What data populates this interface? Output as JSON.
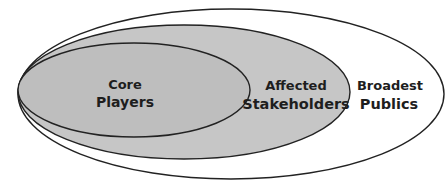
{
  "diagram": {
    "type": "nested-ellipses",
    "layers": [
      {
        "id": "broadest-publics",
        "line1": "Broadest",
        "line2": "Publics",
        "fill": "#ffffff",
        "stroke": "#222222"
      },
      {
        "id": "affected-stakeholders",
        "line1": "Affected",
        "line2": "Stakeholders",
        "fill": "#c4c4c4",
        "stroke": "#222222"
      },
      {
        "id": "core-players",
        "line1": "Core",
        "line2": "Players",
        "fill": "#bdbdbd",
        "stroke": "#222222"
      }
    ]
  }
}
